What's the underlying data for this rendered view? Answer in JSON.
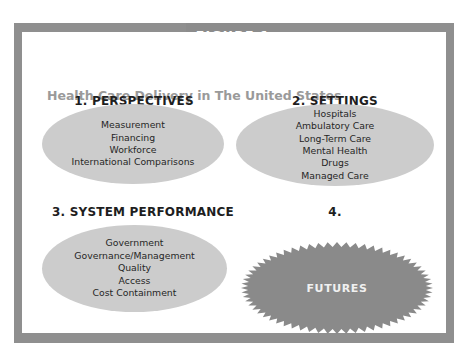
{
  "figure_label": "FIGURE 1",
  "subtitle": "Health Care Delivery in The United States",
  "colors": {
    "frame": "#8f8f8f",
    "tab": "#8c8c8c",
    "ellipse_fill": "#cccccc",
    "starburst_fill": "#8a8a8a",
    "subtitle_text": "#9a9a9a"
  },
  "sections": [
    {
      "title": "1. PERSPECTIVES",
      "items": [
        "Measurement",
        "Financing",
        "Workforce",
        "International Comparisons"
      ]
    },
    {
      "title": "2. SETTINGS",
      "items": [
        "Hospitals",
        "Ambulatory Care",
        "Long-Term Care",
        "Mental Health",
        "Drugs",
        "Managed Care"
      ]
    },
    {
      "title": "3. SYSTEM PERFORMANCE",
      "items": [
        "Government",
        "Governance/Management",
        "Quality",
        "Access",
        "Cost Containment"
      ]
    },
    {
      "title": "4.",
      "shape": "starburst",
      "label": "FUTURES"
    }
  ]
}
